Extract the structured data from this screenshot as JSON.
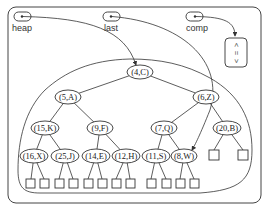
{
  "diagram": {
    "pointers": [
      {
        "id": "heap",
        "label": "heap",
        "target": "(4,C)"
      },
      {
        "id": "last",
        "label": "last",
        "target": "(8,W)"
      },
      {
        "id": "comp",
        "label": "comp",
        "target": "comparator"
      }
    ],
    "comparator": {
      "symbols": [
        "<",
        "=",
        ">"
      ]
    },
    "nodes": [
      {
        "id": "n1",
        "key": 4,
        "value": "C",
        "label": "(4,C)"
      },
      {
        "id": "n2",
        "key": 5,
        "value": "A",
        "label": "(5,A)"
      },
      {
        "id": "n3",
        "key": 6,
        "value": "Z",
        "label": "(6,Z)"
      },
      {
        "id": "n4",
        "key": 15,
        "value": "K",
        "label": "(15,K)"
      },
      {
        "id": "n5",
        "key": 9,
        "value": "F",
        "label": "(9,F)"
      },
      {
        "id": "n6",
        "key": 7,
        "value": "Q",
        "label": "(7,Q)"
      },
      {
        "id": "n7",
        "key": 20,
        "value": "B",
        "label": "(20,B)"
      },
      {
        "id": "n8",
        "key": 16,
        "value": "X",
        "label": "(16,X)"
      },
      {
        "id": "n9",
        "key": 25,
        "value": "J",
        "label": "(25,J)"
      },
      {
        "id": "n10",
        "key": 14,
        "value": "E",
        "label": "(14,E)"
      },
      {
        "id": "n11",
        "key": 12,
        "value": "H",
        "label": "(12,H)"
      },
      {
        "id": "n12",
        "key": 11,
        "value": "S",
        "label": "(11,S)"
      },
      {
        "id": "n13",
        "key": 8,
        "value": "W",
        "label": "(8,W)"
      }
    ],
    "edges": [
      [
        "n1",
        "n2"
      ],
      [
        "n1",
        "n3"
      ],
      [
        "n2",
        "n4"
      ],
      [
        "n2",
        "n5"
      ],
      [
        "n3",
        "n6"
      ],
      [
        "n3",
        "n7"
      ],
      [
        "n4",
        "n8"
      ],
      [
        "n4",
        "n9"
      ],
      [
        "n5",
        "n10"
      ],
      [
        "n5",
        "n11"
      ],
      [
        "n6",
        "n12"
      ],
      [
        "n6",
        "n13"
      ]
    ],
    "leaf_count": 14
  }
}
